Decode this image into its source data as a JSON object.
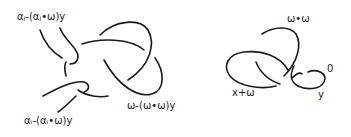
{
  "figure": {
    "left_knot": {
      "labels": {
        "top": "αⱼ-(αⱼ•ω)y",
        "bottom": "αᵢ-(αᵢ•ω)y",
        "right": "ω-(ω•ω)y"
      }
    },
    "right_knot": {
      "labels": {
        "top": "ω•ω",
        "left": "x+ω",
        "small_loop": "0",
        "bottom_right": "y"
      }
    },
    "stroke_color": "#1a1a1a"
  }
}
